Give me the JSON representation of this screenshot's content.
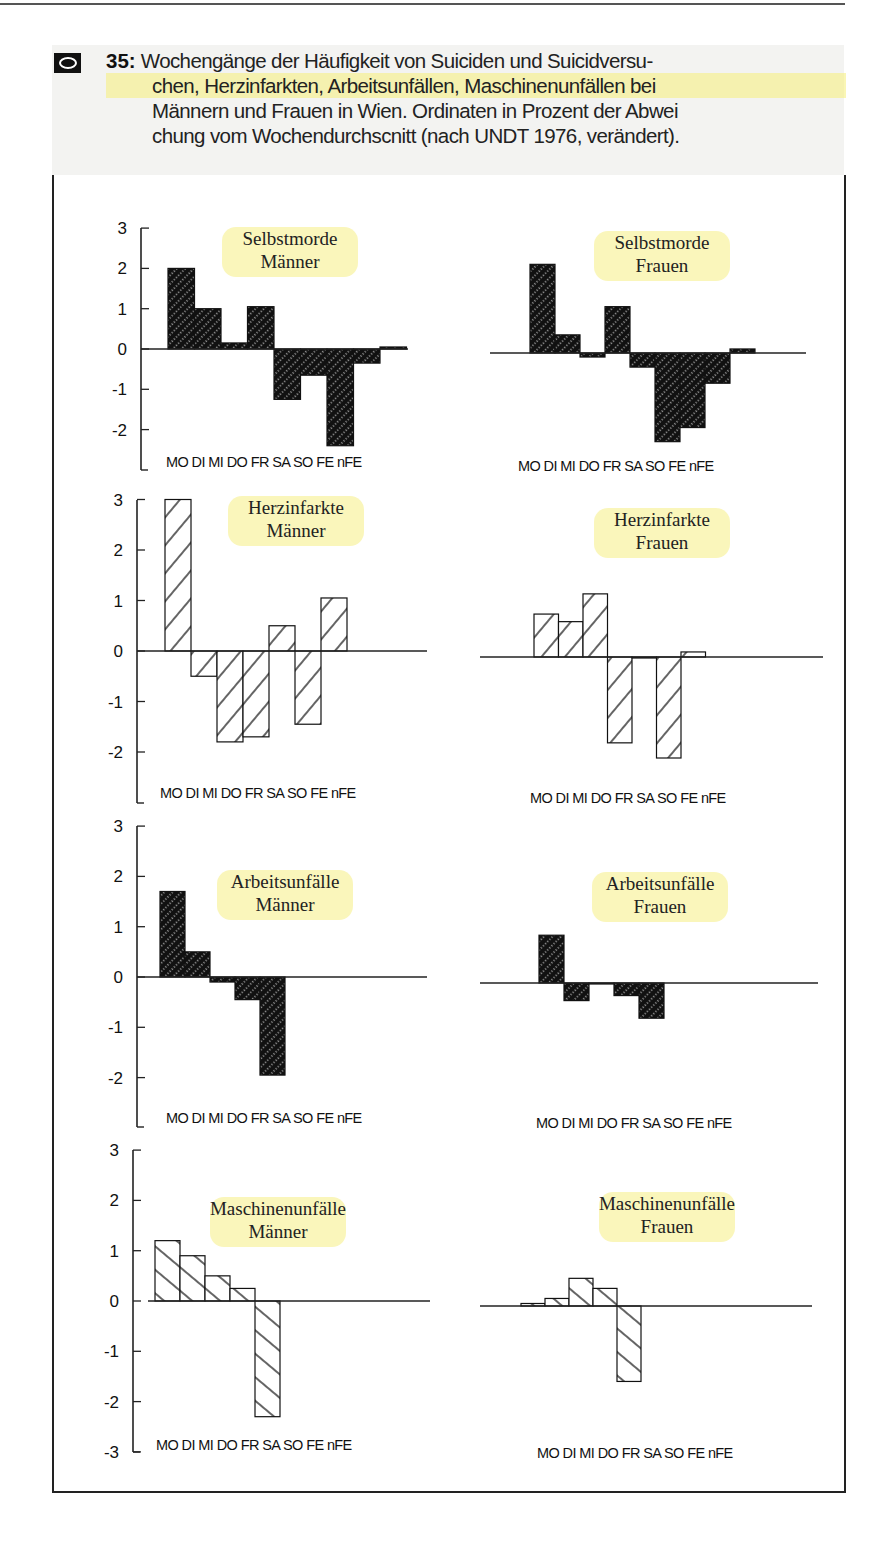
{
  "figure": {
    "number": "35:",
    "badge_icon": "eye-icon",
    "caption_lines": [
      "Wochengänge der Häufigkeit von Suiciden und Suicidversu-",
      "chen, Herzinfarkten, Arbeitsunfällen, Maschinenunfällen bei",
      "Männern und Frauen in Wien. Ordinaten in Prozent der Abwei",
      "chung vom Wochendurchscnitt (nach UNDT 1976, verändert)."
    ],
    "highlight_color": "#f5ee78"
  },
  "chart_data": [
    {
      "type": "bar",
      "title": "Selbstmorde Männer",
      "title_lines": [
        "Selbstmorde",
        "Männer"
      ],
      "categories": [
        "MO",
        "DI",
        "MI",
        "DO",
        "FR",
        "SA",
        "SO",
        "FE",
        "nFE"
      ],
      "values": [
        2.0,
        1.0,
        0.15,
        1.05,
        -1.25,
        -0.65,
        -2.4,
        -0.35,
        0.05
      ],
      "fill": "dark-hatched",
      "ylabel": "Prozent Abweichung vom Wochendurchschnitt",
      "yticks": [
        3,
        2,
        1,
        0,
        -1,
        -2
      ],
      "ylim": [
        -3,
        3
      ]
    },
    {
      "type": "bar",
      "title": "Selbstmorde Frauen",
      "title_lines": [
        "Selbstmorde",
        "Frauen"
      ],
      "categories": [
        "MO",
        "DI",
        "MI",
        "DO",
        "FR",
        "SA",
        "SO",
        "FE",
        "nFE"
      ],
      "values": [
        2.2,
        0.45,
        -0.1,
        1.15,
        -0.35,
        -2.2,
        -1.85,
        -0.75,
        0.1
      ],
      "fill": "dark-hatched",
      "ylim": [
        -3,
        3
      ]
    },
    {
      "type": "bar",
      "title": "Herzinfarkte Männer",
      "title_lines": [
        "Herzinfarkte",
        "Männer"
      ],
      "categories": [
        "MO",
        "DI",
        "MI",
        "DO",
        "FR",
        "SA",
        "SO",
        "FE",
        "nFE"
      ],
      "values": [
        3.0,
        -0.5,
        -1.8,
        -1.7,
        0.5,
        -1.45,
        1.05,
        null,
        null
      ],
      "fill": "light-hatched-forward",
      "yticks": [
        3,
        2,
        1,
        0,
        -1,
        -2
      ],
      "ylim": [
        -3,
        3
      ]
    },
    {
      "type": "bar",
      "title": "Herzinfarkte Frauen",
      "title_lines": [
        "Herzinfarkte",
        "Frauen"
      ],
      "categories": [
        "MO",
        "DI",
        "MI",
        "DO",
        "FR",
        "SA",
        "SO",
        "FE",
        "nFE"
      ],
      "values": [
        0.85,
        0.7,
        1.25,
        -1.7,
        0.0,
        -2.0,
        0.1,
        null,
        null
      ],
      "fill": "light-hatched-forward",
      "ylim": [
        -3,
        3
      ]
    },
    {
      "type": "bar",
      "title": "Arbeitsunfälle Männer",
      "title_lines": [
        "Arbeitsunfälle",
        "Männer"
      ],
      "categories": [
        "MO",
        "DI",
        "MI",
        "DO",
        "FR",
        "SA",
        "SO",
        "FE",
        "nFE"
      ],
      "values": [
        1.7,
        0.5,
        -0.1,
        -0.45,
        -1.95,
        null,
        null,
        null,
        null
      ],
      "fill": "dark-hatched",
      "yticks": [
        3,
        2,
        1,
        0,
        -1,
        -2
      ],
      "ylim": [
        -3,
        3
      ]
    },
    {
      "type": "bar",
      "title": "Arbeitsunfälle Frauen",
      "title_lines": [
        "Arbeitsunfälle",
        "Frauen"
      ],
      "categories": [
        "MO",
        "DI",
        "MI",
        "DO",
        "FR",
        "SA",
        "SO",
        "FE",
        "nFE"
      ],
      "values": [
        0.95,
        -0.35,
        0.0,
        -0.25,
        -0.7,
        null,
        null,
        null,
        null
      ],
      "fill": "dark-hatched",
      "ylim": [
        -3,
        3
      ]
    },
    {
      "type": "bar",
      "title": "Maschinenunfälle Männer",
      "title_lines": [
        "Maschinenunfälle",
        "Männer"
      ],
      "categories": [
        "MO",
        "DI",
        "MI",
        "DO",
        "FR",
        "SA",
        "SO",
        "FE",
        "nFE"
      ],
      "values": [
        1.2,
        0.9,
        0.5,
        0.25,
        -2.3,
        null,
        null,
        null,
        null
      ],
      "fill": "light-hatched-backward",
      "yticks": [
        3,
        2,
        1,
        0,
        -1,
        -2,
        -3
      ],
      "ylim": [
        -3,
        3
      ]
    },
    {
      "type": "bar",
      "title": "Maschinenunfälle Frauen",
      "title_lines": [
        "Maschinenunfälle",
        "Frauen"
      ],
      "categories": [
        "MO",
        "DI",
        "MI",
        "DO",
        "FR",
        "SA",
        "SO",
        "FE",
        "nFE"
      ],
      "values": [
        0.05,
        0.15,
        0.55,
        0.35,
        -1.5,
        null,
        null,
        null,
        null
      ],
      "fill": "light-hatched-backward",
      "ylim": [
        -3,
        3
      ]
    }
  ],
  "x_axis_label": "MO DI MI DO FR SA SO FE nFE"
}
